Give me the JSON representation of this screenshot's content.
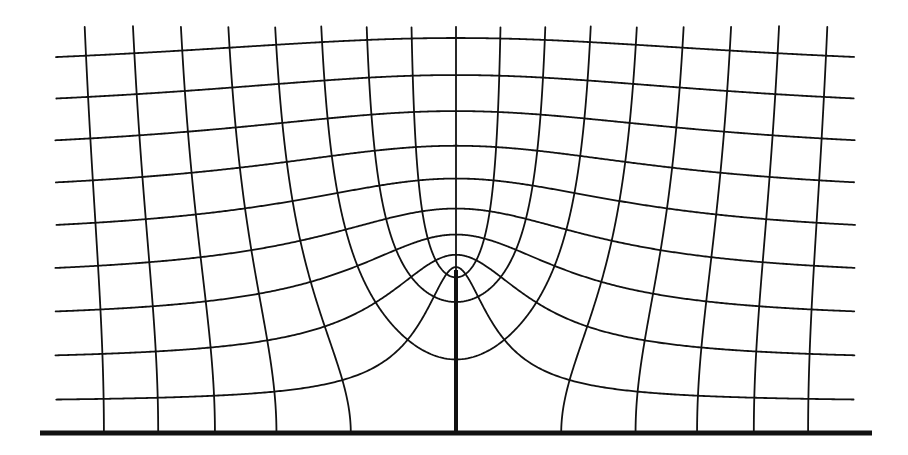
{
  "diagram": {
    "type": "conformal-grid",
    "colors": {
      "line": "#111111",
      "background": "#ffffff"
    },
    "origin": {
      "x": 456,
      "y": 433
    },
    "slit_height": 163,
    "baseline": {
      "x1": 40,
      "x2": 872,
      "y": 433
    },
    "clip": {
      "left": -401,
      "right": 399,
      "top": 407
    },
    "vertical_family": {
      "spacing": 48.5,
      "k_min": -8,
      "k_max": 8
    },
    "horizontal_family": {
      "start": 31,
      "spacing": 41.1,
      "count": 9
    }
  }
}
